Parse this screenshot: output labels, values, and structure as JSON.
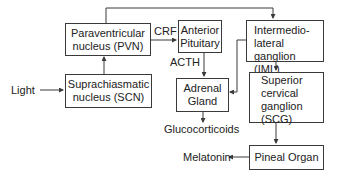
{
  "diagram": {
    "nodes": {
      "pvn": {
        "line1": "Paraventricular",
        "line2": "nucleus (PVN)"
      },
      "scn": {
        "line1": "Suprachiasmatic",
        "line2": "nucleus (SCN)"
      },
      "anterior_pituitary": {
        "line1": "Anterior",
        "line2": "Pituitary"
      },
      "iml": {
        "line1": "Intermedio-",
        "line2": "lateral ganglion",
        "line3": "(IML)"
      },
      "adrenal": {
        "line1": "Adrenal",
        "line2": "Gland"
      },
      "scg": {
        "line1": "Superior",
        "line2": "cervical",
        "line3": "ganglion",
        "line4": "(SCG)"
      },
      "pineal": {
        "line1": "Pineal Organ"
      }
    },
    "labels": {
      "light": "Light",
      "crf": "CRF",
      "acth": "ACTH",
      "glucocorticoids": "Glucocorticoids",
      "melatonin": "Melatonin"
    },
    "edges": [
      {
        "from": "Light",
        "to": "SCN"
      },
      {
        "from": "SCN",
        "to": "PVN"
      },
      {
        "from": "PVN",
        "to": "Anterior Pituitary",
        "label": "CRF"
      },
      {
        "from": "PVN",
        "to": "IML"
      },
      {
        "from": "Anterior Pituitary",
        "to": "Adrenal Gland",
        "label": "ACTH"
      },
      {
        "from": "IML",
        "to": "Adrenal Gland"
      },
      {
        "from": "IML",
        "to": "SCG"
      },
      {
        "from": "Adrenal Gland",
        "to": "Glucocorticoids"
      },
      {
        "from": "SCG",
        "to": "Pineal Organ"
      },
      {
        "from": "Pineal Organ",
        "to": "Melatonin"
      }
    ],
    "colors": {
      "line": "#3a3a3a",
      "text": "#222222",
      "background": "#ffffff"
    }
  }
}
